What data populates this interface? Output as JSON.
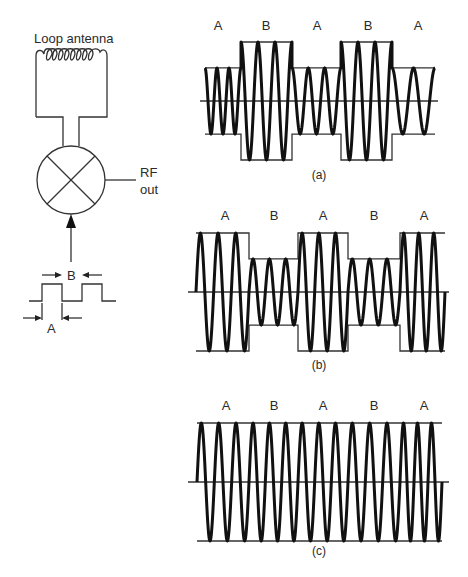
{
  "circuit": {
    "antenna_label": "Loop antenna",
    "output_label_line1": "RF",
    "output_label_line2": "out",
    "pulse_label_b": "B",
    "pulse_label_a": "A"
  },
  "panels": [
    {
      "caption": "(a)",
      "segment_labels": [
        "A",
        "B",
        "A",
        "B",
        "A"
      ]
    },
    {
      "caption": "(b)",
      "segment_labels": [
        "A",
        "B",
        "A",
        "B",
        "A"
      ]
    },
    {
      "caption": "(c)",
      "segment_labels": [
        "A",
        "B",
        "A",
        "B",
        "A"
      ]
    }
  ],
  "chart_data": [
    {
      "type": "line",
      "title": "(a)",
      "description": "Amplitude-modulated RF: small amplitude in A segments, large amplitude in B segments",
      "categories": [
        "A",
        "B",
        "A",
        "B",
        "A"
      ],
      "series": [
        {
          "name": "relative amplitude",
          "values": [
            0.56,
            1.0,
            0.56,
            1.0,
            0.56
          ]
        }
      ],
      "cycles_per_segment": [
        3,
        3,
        3,
        3,
        2
      ]
    },
    {
      "type": "line",
      "title": "(b)",
      "description": "Amplitude-modulated RF: large amplitude in A segments, small amplitude in B segments",
      "categories": [
        "A",
        "B",
        "A",
        "B",
        "A"
      ],
      "series": [
        {
          "name": "relative amplitude",
          "values": [
            1.0,
            0.56,
            1.0,
            0.56,
            1.0
          ]
        }
      ],
      "cycles_per_segment": [
        3,
        3,
        3,
        3,
        3
      ]
    },
    {
      "type": "line",
      "title": "(c)",
      "description": "Constant-amplitude RF: equal amplitude in all segments",
      "categories": [
        "A",
        "B",
        "A",
        "B",
        "A"
      ],
      "series": [
        {
          "name": "relative amplitude",
          "values": [
            1.0,
            1.0,
            1.0,
            1.0,
            1.0
          ]
        }
      ],
      "cycles_per_segment": [
        3,
        3,
        3,
        3,
        3
      ]
    }
  ]
}
